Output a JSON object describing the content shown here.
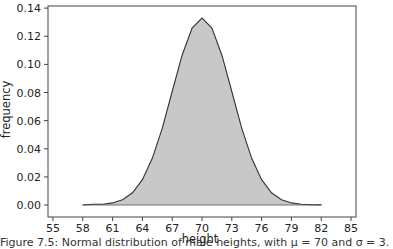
{
  "chart_data": {
    "type": "area",
    "title": "",
    "xlabel": "height",
    "ylabel": "frequency",
    "xlim": [
      54.5,
      85.5
    ],
    "ylim": [
      -0.0085,
      0.1415
    ],
    "grid": false,
    "legend": null,
    "x_ticks": [
      55,
      58,
      61,
      64,
      67,
      70,
      73,
      76,
      79,
      82,
      85
    ],
    "y_ticks": [
      "0.00",
      "0.02",
      "0.04",
      "0.06",
      "0.08",
      "0.10",
      "0.12",
      "0.14"
    ],
    "fill_color": "#c8c8c8",
    "line_color": "#333333",
    "x": [
      58,
      59,
      60,
      61,
      62,
      63,
      64,
      65,
      66,
      67,
      68,
      69,
      70,
      71,
      72,
      73,
      74,
      75,
      76,
      77,
      78,
      79,
      80,
      81,
      82
    ],
    "values": [
      0.0001,
      0.0006,
      0.0005,
      0.0015,
      0.0038,
      0.0087,
      0.018,
      0.0332,
      0.0547,
      0.0807,
      0.1065,
      0.1258,
      0.133,
      0.1258,
      0.1065,
      0.0807,
      0.0547,
      0.0332,
      0.018,
      0.0087,
      0.0038,
      0.0015,
      0.0005,
      0.0002,
      0.0001
    ]
  },
  "caption": "Figure 7.5: Normal distribution of male heights, with μ = 70 and σ = 3."
}
